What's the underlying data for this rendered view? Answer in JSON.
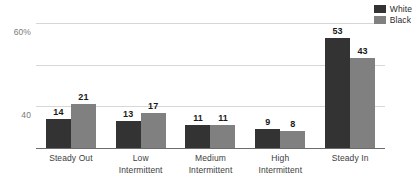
{
  "chart_data": {
    "type": "bar",
    "title": "",
    "subtitle": "",
    "xlabel": "",
    "ylabel": "",
    "categories": [
      "Steady Out",
      "Low Intermittent",
      "Medium Intermittent",
      "High Intermittent",
      "Steady In"
    ],
    "category_lines": [
      [
        "Steady Out"
      ],
      [
        "Low",
        "Intermittent"
      ],
      [
        "Medium",
        "Intermittent"
      ],
      [
        "High",
        "Intermittent"
      ],
      [
        "Steady In"
      ]
    ],
    "series": [
      {
        "name": "White",
        "color": "#333333",
        "values": [
          14,
          13,
          11,
          9,
          53
        ]
      },
      {
        "name": "Black",
        "color": "#808080",
        "values": [
          21,
          17,
          11,
          8,
          43
        ]
      }
    ],
    "ylim": [
      0,
      60
    ],
    "yticks": [
      0,
      20,
      40,
      60
    ],
    "ytick_labels": [
      "0",
      "20",
      "40",
      "60%"
    ],
    "grid": true,
    "legend_position": "top-right",
    "data_labels": true
  },
  "legend": {
    "items": [
      {
        "label": "White",
        "color": "#333333"
      },
      {
        "label": "Black",
        "color": "#808080"
      }
    ]
  },
  "colors": {
    "series_white": "#333333",
    "series_black": "#808080",
    "gridline": "#d6d6d6",
    "axis": "#6d6d6d",
    "tick_text": "#7a7a7a",
    "category_text": "#3d3d3d",
    "value_text": "#1a1a1a",
    "background": "#ffffff"
  }
}
